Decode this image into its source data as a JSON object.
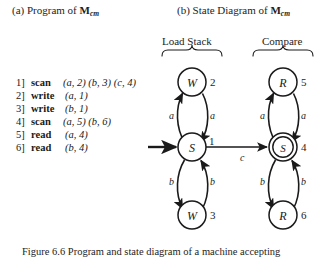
{
  "panels": {
    "a": {
      "prefix": "(a) Program of ",
      "machine": "M",
      "machine_sub": "cm"
    },
    "b": {
      "prefix": "(b) State Diagram of ",
      "machine": "M",
      "machine_sub": "cm"
    }
  },
  "program": {
    "lines": [
      {
        "num": "1]",
        "op": "scan",
        "args": "(a, 2) (b, 3) (c, 4)"
      },
      {
        "num": "2]",
        "op": "write",
        "args": "(a, 1)"
      },
      {
        "num": "3]",
        "op": "write",
        "args": "(b, 1)"
      },
      {
        "num": "4]",
        "op": "scan",
        "args": "(a, 5) (b, 6)"
      },
      {
        "num": "5]",
        "op": "read",
        "args": "(a, 4)"
      },
      {
        "num": "6]",
        "op": "read",
        "args": "(b, 4)"
      }
    ]
  },
  "diagram": {
    "groups": [
      {
        "id": "load-stack",
        "label": "Load Stack"
      },
      {
        "id": "compare",
        "label": "Compare"
      }
    ],
    "nodes": [
      {
        "id": "w2",
        "symbol": "W",
        "number": "2",
        "accepting": false
      },
      {
        "id": "s1",
        "symbol": "S",
        "number": "1",
        "accepting": false
      },
      {
        "id": "w3",
        "symbol": "W",
        "number": "3",
        "accepting": false
      },
      {
        "id": "r5",
        "symbol": "R",
        "number": "5",
        "accepting": false
      },
      {
        "id": "s4",
        "symbol": "S",
        "number": "4",
        "accepting": true
      },
      {
        "id": "r6",
        "symbol": "R",
        "number": "6",
        "accepting": false
      }
    ],
    "edge_labels": [
      {
        "id": "a-left-up",
        "text": "a"
      },
      {
        "id": "a-left-down",
        "text": "a"
      },
      {
        "id": "b-left-down",
        "text": "b"
      },
      {
        "id": "b-left-up",
        "text": "b"
      },
      {
        "id": "c-bridge",
        "text": "c"
      },
      {
        "id": "a-right-up",
        "text": "a"
      },
      {
        "id": "a-right-down",
        "text": "a"
      },
      {
        "id": "b-right-down",
        "text": "b"
      },
      {
        "id": "b-right-up",
        "text": "b"
      }
    ],
    "colors": {
      "stroke": "#1a1a1a",
      "fill": "#ffffff"
    }
  },
  "figure_caption": {
    "text": "Figure 6.6  Program and state diagram of a machine accepting"
  }
}
